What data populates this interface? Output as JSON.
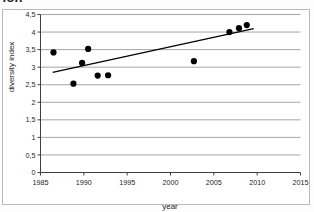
{
  "figure": {
    "clipped_title": "ion",
    "background_color": "#ffffff",
    "frame_color": "#b9b9b9"
  },
  "chart_data": {
    "type": "scatter",
    "title": "ion",
    "xlabel": "year",
    "ylabel": "diversity index",
    "xlim": [
      1985,
      2015
    ],
    "ylim": [
      0,
      4.5
    ],
    "xticks": [
      1985,
      1990,
      1995,
      2000,
      2005,
      2010,
      2015
    ],
    "xtick_labels": [
      "1985",
      "1990",
      "1995",
      "2000",
      "2005",
      "2010",
      "2015"
    ],
    "yticks": [
      0,
      0.5,
      1,
      1.5,
      2,
      2.5,
      3,
      3.5,
      4,
      4.5
    ],
    "ytick_labels": [
      "0",
      "0,5",
      "1",
      "1,5",
      "2",
      "2,5",
      "3",
      "3,5",
      "4",
      "4,5"
    ],
    "grid": "horizontal",
    "grid_color": "#808080",
    "legend": "none",
    "marker_color": "#000000",
    "marker_shape": "circle",
    "points": [
      {
        "x": 1986.5,
        "y": 3.42
      },
      {
        "x": 1988.8,
        "y": 2.53
      },
      {
        "x": 1989.8,
        "y": 3.12
      },
      {
        "x": 1990.5,
        "y": 3.52
      },
      {
        "x": 1991.6,
        "y": 2.76
      },
      {
        "x": 1992.8,
        "y": 2.77
      },
      {
        "x": 2002.7,
        "y": 3.17
      },
      {
        "x": 2006.8,
        "y": 4.0
      },
      {
        "x": 2007.9,
        "y": 4.11
      },
      {
        "x": 2008.8,
        "y": 4.2
      }
    ],
    "series": [
      {
        "name": "diversity index",
        "x": [
          1986.5,
          1988.8,
          1989.8,
          1990.5,
          1991.6,
          1992.8,
          2002.7,
          2006.8,
          2007.9,
          2008.8
        ],
        "values": [
          3.42,
          2.53,
          3.12,
          3.52,
          2.76,
          2.77,
          3.17,
          4.0,
          4.11,
          4.2
        ]
      }
    ],
    "trendline": {
      "type": "linear",
      "color": "#000000",
      "x_start": 1986.4,
      "y_start": 2.85,
      "x_end": 2009.6,
      "y_end": 4.1
    }
  }
}
